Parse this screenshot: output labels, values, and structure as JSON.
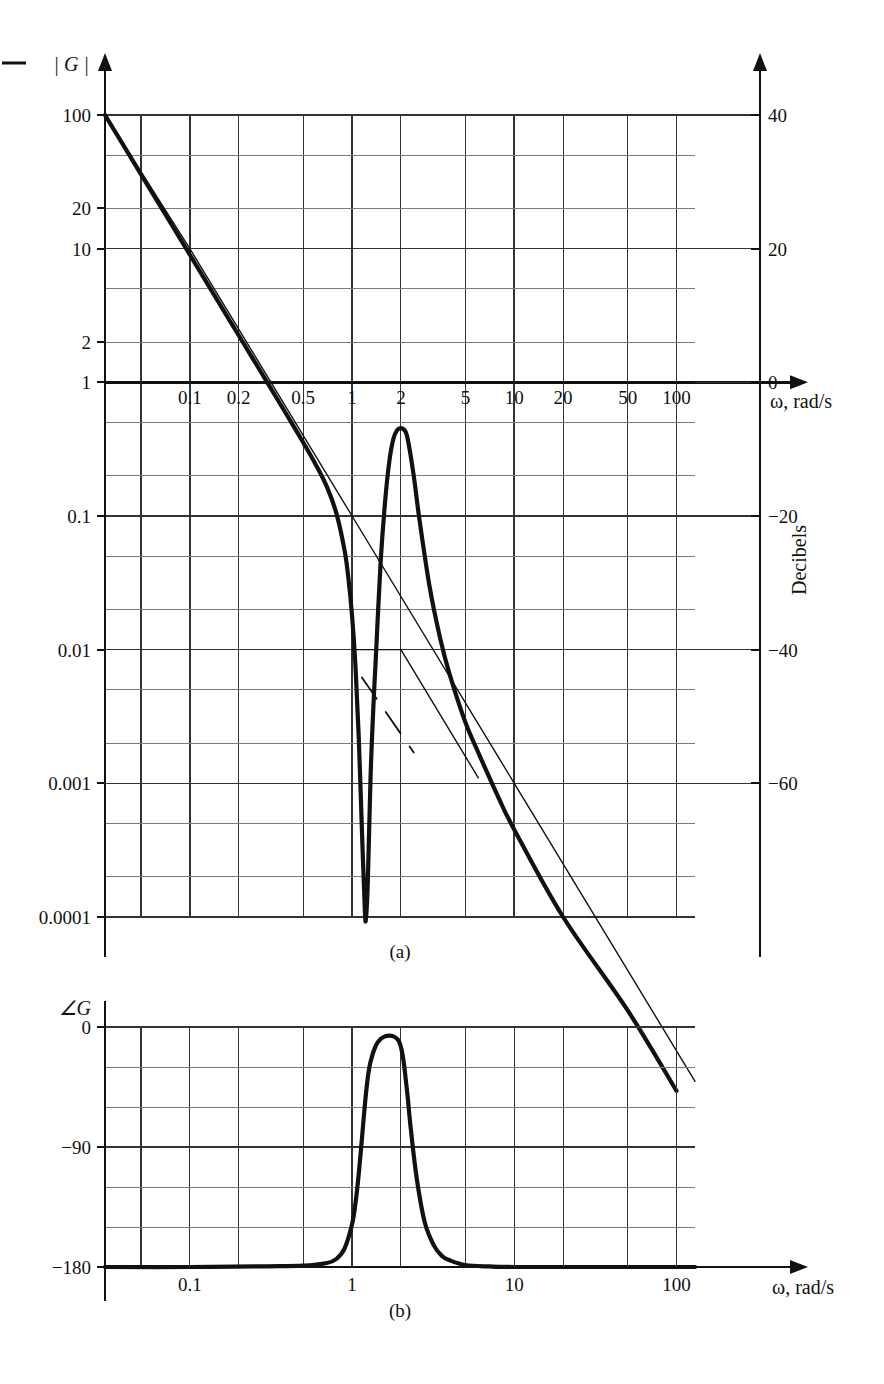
{
  "figure": {
    "panels": [
      {
        "id": "a",
        "caption": "(a)"
      },
      {
        "id": "b",
        "caption": "(b)"
      }
    ]
  },
  "panel_a": {
    "y_axis_name": "| G |",
    "y_ticks": [
      "100",
      "20",
      "10",
      "2",
      "1",
      "0.1",
      "0.01",
      "0.001",
      "0.0001"
    ],
    "x_ticks": [
      "0.1",
      "0.2",
      "0.5",
      "1",
      "2",
      "5",
      "10",
      "20",
      "50",
      "100"
    ],
    "x_axis_name": "ω, rad/s",
    "right_axis_name": "Decibels",
    "right_ticks": [
      "40",
      "20",
      "0",
      "−20",
      "−40",
      "−60"
    ]
  },
  "panel_b": {
    "y_axis_name": "∠G",
    "y_ticks": [
      "0",
      "−90",
      "−180"
    ],
    "x_ticks": [
      "0.1",
      "1",
      "10",
      "100"
    ],
    "x_axis_name": "ω, rad/s"
  },
  "colors": {
    "ink": "#111111",
    "grid_major": "#333333",
    "grid_minor": "#7a7a7a",
    "background": "#ffffff"
  },
  "chart_data": [
    {
      "type": "line",
      "title": "Magnitude Bode plot of notch/resonant system",
      "panel": "a",
      "xlabel": "ω, rad/s",
      "ylabel": "| G |",
      "y2label": "Decibels",
      "xscale": "log",
      "yscale": "log",
      "xlim": [
        0.03,
        130
      ],
      "ylim": [
        0.0001,
        100
      ],
      "y2lim": [
        -80,
        40
      ],
      "grid": true,
      "legend": "none",
      "xticks": [
        0.1,
        0.2,
        0.5,
        1,
        2,
        5,
        10,
        20,
        50,
        100
      ],
      "yticks": [
        100,
        20,
        10,
        2,
        1,
        0.1,
        0.01,
        0.001,
        0.0001
      ],
      "y2ticks": [
        40,
        20,
        0,
        -20,
        -40,
        -60
      ],
      "series": [
        {
          "name": "exact magnitude",
          "style": "solid-thick",
          "x": [
            0.03,
            0.05,
            0.08,
            0.1,
            0.15,
            0.2,
            0.3,
            0.4,
            0.5,
            0.6,
            0.7,
            0.8,
            0.9,
            0.95,
            1.0,
            1.05,
            1.1,
            1.15,
            1.2,
            1.22,
            1.25,
            1.3,
            1.35,
            1.4,
            1.5,
            1.6,
            1.7,
            1.8,
            1.9,
            2.0,
            2.1,
            2.2,
            2.4,
            2.6,
            3.0,
            3.5,
            4.0,
            5.0,
            6.0,
            8.0,
            10.0,
            20.0,
            50.0,
            100.0
          ],
          "y": [
            100,
            36.0,
            14.1,
            9.0,
            4.0,
            2.25,
            1.0,
            0.56,
            0.355,
            0.24,
            0.165,
            0.105,
            0.055,
            0.034,
            0.018,
            0.0075,
            0.0022,
            0.00045,
            0.00011,
            0.0001,
            0.00018,
            0.0011,
            0.0035,
            0.0085,
            0.045,
            0.13,
            0.26,
            0.38,
            0.44,
            0.455,
            0.44,
            0.38,
            0.2,
            0.095,
            0.03,
            0.012,
            0.0065,
            0.00285,
            0.0017,
            0.00078,
            0.00045,
            0.0001,
            2e-05,
            5e-06
          ]
        },
        {
          "name": "asymptote -40 dB/dec",
          "style": "solid-thin",
          "x": [
            0.03,
            0.1,
            1.0,
            10.0,
            130.0
          ],
          "y": [
            100,
            10.0,
            0.1,
            0.001,
            5.9e-06
          ]
        },
        {
          "name": "asymptote notch floor",
          "style": "solid-thin",
          "x": [
            1.0,
            2.0
          ],
          "y": [
            0.01,
            0.01
          ]
        },
        {
          "name": "asymptote +40 dB/dec segment",
          "style": "solid-thin",
          "x": [
            2.0,
            6.0
          ],
          "y": [
            0.01,
            0.0011
          ]
        },
        {
          "name": "dashed construction line",
          "style": "dashed",
          "x": [
            1.15,
            2.4
          ],
          "y": [
            0.0062,
            0.0017
          ]
        }
      ]
    },
    {
      "type": "line",
      "title": "Phase Bode plot",
      "panel": "b",
      "xlabel": "ω, rad/s",
      "ylabel": "∠G",
      "xscale": "log",
      "yscale": "linear",
      "xlim": [
        0.03,
        130
      ],
      "ylim": [
        -180,
        0
      ],
      "grid": true,
      "legend": "none",
      "xticks": [
        0.1,
        1,
        10,
        100
      ],
      "yticks": [
        0,
        -90,
        -180
      ],
      "series": [
        {
          "name": "phase",
          "style": "solid-thick",
          "x": [
            0.03,
            0.1,
            0.3,
            0.5,
            0.7,
            0.8,
            0.9,
            1.0,
            1.05,
            1.1,
            1.15,
            1.2,
            1.25,
            1.3,
            1.4,
            1.5,
            1.6,
            1.7,
            1.8,
            1.9,
            1.95,
            2.0,
            2.05,
            2.1,
            2.2,
            2.3,
            2.5,
            2.8,
            3.2,
            3.6,
            4.0,
            5.0,
            7.0,
            10.0,
            30.0,
            100.0,
            130.0
          ],
          "y": [
            -180,
            -180,
            -179.5,
            -179,
            -177,
            -174,
            -166,
            -148,
            -132,
            -110,
            -84,
            -58,
            -38,
            -26,
            -14,
            -9,
            -7,
            -6.5,
            -7,
            -9,
            -11,
            -15,
            -21,
            -30,
            -52,
            -76,
            -113,
            -146,
            -164,
            -172,
            -175,
            -178.5,
            -179.6,
            -180,
            -180,
            -180,
            -180
          ]
        }
      ]
    }
  ]
}
